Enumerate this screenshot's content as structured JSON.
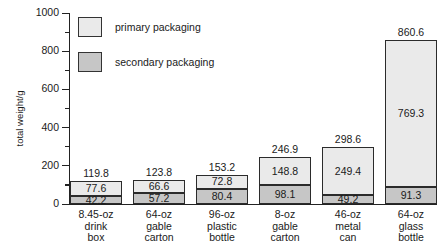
{
  "chart_data": {
    "type": "bar",
    "subtype": "stacked-vertical",
    "title": "",
    "xlabel": "",
    "ylabel": "total weight/g",
    "ylim": [
      0,
      1000
    ],
    "ytick_values": [
      0,
      200,
      400,
      600,
      800,
      1000
    ],
    "ytick_labels": [
      "0",
      "200",
      "400",
      "600",
      "800",
      "1000"
    ],
    "minor_ytick_values": [
      100,
      300,
      500,
      700,
      900
    ],
    "grid": false,
    "legend_position": "upper-left-inside",
    "categories": [
      "8.45-oz drink box",
      "64-oz gable carton",
      "96-oz plastic bottle",
      "8-oz gable carton",
      "46-oz metal can",
      "64-oz glass bottle"
    ],
    "category_lines": [
      [
        "8.45-oz",
        "drink",
        "box"
      ],
      [
        "64-oz",
        "gable",
        "carton"
      ],
      [
        "96-oz",
        "plastic",
        "bottle"
      ],
      [
        "8-oz",
        "gable",
        "carton"
      ],
      [
        "46-oz",
        "metal",
        "can"
      ],
      [
        "64-oz",
        "glass",
        "bottle"
      ]
    ],
    "series": [
      {
        "name": "primary packaging",
        "color": "#eaeaea",
        "values": [
          77.6,
          66.6,
          72.8,
          148.8,
          249.4,
          769.3
        ]
      },
      {
        "name": "secondary packaging",
        "color": "#c6c6c6",
        "values": [
          42.2,
          57.2,
          80.4,
          98.1,
          49.2,
          91.3
        ]
      }
    ],
    "totals": [
      119.8,
      123.8,
      153.2,
      246.9,
      298.6,
      860.6
    ],
    "total_labels": [
      "119.8",
      "123.8",
      "153.2",
      "246.9",
      "298.6",
      "860.6"
    ],
    "primary_labels": [
      "77.6",
      "66.6",
      "72.8",
      "148.8",
      "249.4",
      "769.3"
    ],
    "secondary_labels": [
      "42.2",
      "57.2",
      "80.4",
      "98.1",
      "49.2",
      "91.3"
    ]
  },
  "legend": {
    "items": [
      {
        "label": "primary packaging",
        "swatch": "#eaeaea"
      },
      {
        "label": "secondary packaging",
        "swatch": "#c6c6c6"
      }
    ]
  },
  "axis": {
    "y_title": "total weight/g",
    "y_labels": [
      "1000",
      "800",
      "600",
      "400",
      "200",
      "0"
    ]
  }
}
